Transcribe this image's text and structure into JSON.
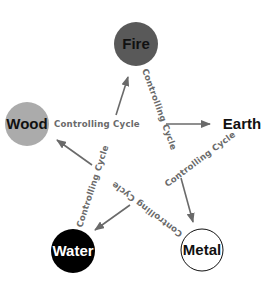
{
  "diagram": {
    "type": "five-elements-controlling-cycle",
    "nodes": [
      {
        "id": "fire",
        "label": "Fire",
        "fill": "#595959",
        "stroke": "none",
        "text_color": "#111111"
      },
      {
        "id": "wood",
        "label": "Wood",
        "fill": "#ababab",
        "stroke": "none",
        "text_color": "#111111"
      },
      {
        "id": "earth",
        "label": "Earth",
        "fill": "none",
        "stroke": "none",
        "text_color": "#111111"
      },
      {
        "id": "water",
        "label": "Water",
        "fill": "#000000",
        "stroke": "none",
        "text_color": "#ffffff"
      },
      {
        "id": "metal",
        "label": "Metal",
        "fill": "#ffffff",
        "stroke": "#111111",
        "text_color": "#111111"
      }
    ],
    "edges": [
      {
        "from": "wood",
        "to": "earth",
        "label": "Controlling Cycle"
      },
      {
        "from": "fire",
        "to": "metal",
        "label": "Controlling Cycle"
      },
      {
        "from": "earth",
        "to": "water",
        "label": "Controlling Cycle"
      },
      {
        "from": "metal",
        "to": "wood",
        "label": "Controlling Cycle"
      },
      {
        "from": "water",
        "to": "fire",
        "label": "Controlling Cycle"
      }
    ],
    "colors": {
      "arrow": "#6a6a6a",
      "label": "#6a6a6a"
    }
  }
}
